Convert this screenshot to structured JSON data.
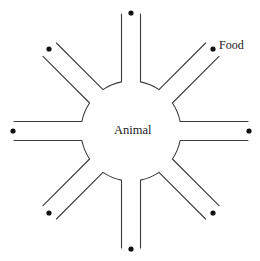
{
  "diagram": {
    "center_label": "Animal",
    "food_label": "Food",
    "center": [
      131,
      131
    ],
    "hub_radius": 50,
    "arm_half_width": 9.5,
    "arm_length": 117,
    "arm_count": 8,
    "arm_angles_deg": [
      -90,
      -45,
      0,
      45,
      90,
      135,
      180,
      225
    ],
    "colors": {
      "line": "#3a3a3a",
      "dot": "#111111",
      "background": "#ffffff"
    },
    "arms": [
      {
        "id": "north",
        "angle": -90,
        "has_food": true
      },
      {
        "id": "north-east",
        "angle": -45,
        "has_food": true,
        "labeled_food": true
      },
      {
        "id": "east",
        "angle": 0,
        "has_food": true
      },
      {
        "id": "south-east",
        "angle": 45,
        "has_food": true
      },
      {
        "id": "south",
        "angle": 90,
        "has_food": true
      },
      {
        "id": "south-west",
        "angle": 135,
        "has_food": true
      },
      {
        "id": "west",
        "angle": 180,
        "has_food": true
      },
      {
        "id": "north-west",
        "angle": 225,
        "has_food": true
      }
    ]
  }
}
